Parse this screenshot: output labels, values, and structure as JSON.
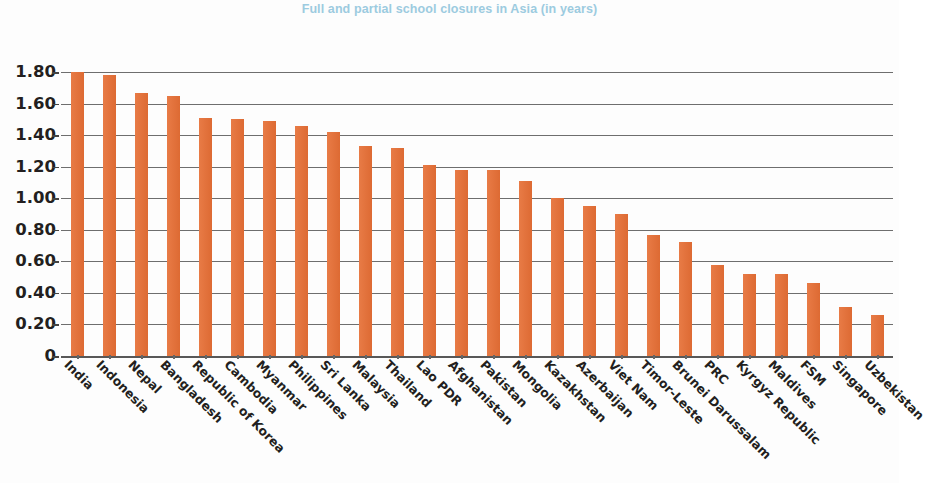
{
  "chart": {
    "title": "Full and partial school closures in Asia (in years)",
    "title_color": "#9ccbe0",
    "bar_color": "#e3703a"
  },
  "chart_data": {
    "type": "bar",
    "title": "Full and partial school closures in Asia (in years)",
    "xlabel": "",
    "ylabel": "",
    "ylim": [
      0,
      1.8
    ],
    "grid": true,
    "legend": false,
    "ytick_labels": [
      "1.80",
      "1.60",
      "1.40",
      "1.20",
      "1.00",
      "0.80",
      "0.60",
      "0.40",
      "0.20",
      "0"
    ],
    "ytick_values": [
      1.8,
      1.6,
      1.4,
      1.2,
      1.0,
      0.8,
      0.6,
      0.4,
      0.2,
      0
    ],
    "categories": [
      "India",
      "Indonesia",
      "Nepal",
      "Bangladesh",
      "Republic of Korea",
      "Cambodia",
      "Myanmar",
      "Philippines",
      "Sri Lanka",
      "Malaysia",
      "Thailand",
      "Lao PDR",
      "Afghanistan",
      "Pakistan",
      "Mongolia",
      "Kazakhstan",
      "Azerbaijan",
      "Viet Nam",
      "Timor-Leste",
      "Brunei Darussalam",
      "PRC",
      "Kyrgyz Republic",
      "Maldives",
      "FSM",
      "Singapore",
      "Uzbekistan"
    ],
    "values": [
      1.8,
      1.78,
      1.67,
      1.65,
      1.51,
      1.5,
      1.49,
      1.46,
      1.42,
      1.33,
      1.32,
      1.21,
      1.18,
      1.18,
      1.11,
      1.0,
      0.95,
      0.9,
      0.77,
      0.72,
      0.58,
      0.52,
      0.52,
      0.46,
      0.31,
      0.26
    ]
  }
}
